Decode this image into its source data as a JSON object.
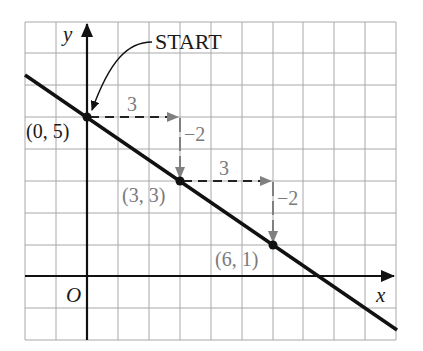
{
  "diagram": {
    "type": "slope-of-line-graph",
    "axes": {
      "x_label": "x",
      "y_label": "y",
      "origin_label": "O"
    },
    "grid": {
      "columns": 12,
      "rows": 10,
      "x_min": -2,
      "x_max": 10,
      "y_min": -2,
      "y_max": 8
    },
    "start_label": "START",
    "points": [
      {
        "label": "(0, 5)",
        "x": 0,
        "y": 5
      },
      {
        "label": "(3, 3)",
        "x": 3,
        "y": 3
      },
      {
        "label": "(6, 1)",
        "x": 6,
        "y": 1
      }
    ],
    "steps": [
      {
        "run_label": "3",
        "rise_label": "−2"
      },
      {
        "run_label": "3",
        "rise_label": "−2"
      }
    ],
    "line": {
      "slope": "-2/3",
      "y_intercept": 5
    },
    "colors": {
      "line": "#111111",
      "grid": "#a8a8a8",
      "arrows": "#808080",
      "text": "#1a1a1a"
    }
  }
}
